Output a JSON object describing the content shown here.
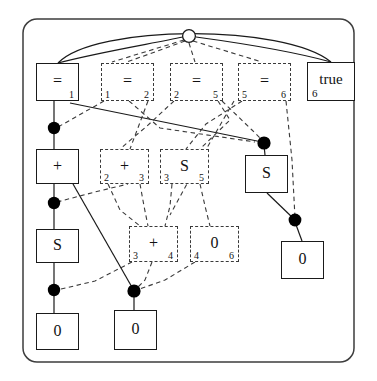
{
  "figure": {
    "frame": {
      "shape": "rounded-rectangle",
      "stroke": "#3d3d3d"
    },
    "colors": {
      "solid_stroke": "#1a1a1a",
      "dashed_stroke": "#3a3a3a",
      "node_fill": "#ffffff",
      "dot_fill": "#000000",
      "root_fill": "#ffffff"
    },
    "root": {
      "label": "",
      "kind": "hollow-circle",
      "x": 189,
      "y": 36,
      "r": 6
    },
    "nodes": [
      {
        "id": "eq1",
        "symbol": "=",
        "sub_left": "",
        "sub_right": "1",
        "style": "solid",
        "x": 36,
        "y": 63,
        "w": 43,
        "h": 38
      },
      {
        "id": "eq12",
        "symbol": "=",
        "sub_left": "1",
        "sub_right": "2",
        "style": "dashed",
        "x": 101,
        "y": 63,
        "w": 53,
        "h": 38
      },
      {
        "id": "eq25",
        "symbol": "=",
        "sub_left": "2",
        "sub_right": "5",
        "style": "dashed",
        "x": 170,
        "y": 63,
        "w": 53,
        "h": 38
      },
      {
        "id": "eq56",
        "symbol": "=",
        "sub_left": "5",
        "sub_right": "6",
        "style": "dashed",
        "x": 238,
        "y": 63,
        "w": 53,
        "h": 38
      },
      {
        "id": "true6",
        "symbol": "true",
        "sub_left": "6",
        "sub_right": "",
        "style": "solid",
        "x": 307,
        "y": 62,
        "w": 48,
        "h": 39
      },
      {
        "id": "plusL",
        "symbol": "+",
        "sub_left": "",
        "sub_right": "",
        "style": "solid",
        "x": 36,
        "y": 149,
        "w": 43,
        "h": 35
      },
      {
        "id": "plus23",
        "symbol": "+",
        "sub_left": "2",
        "sub_right": "3",
        "style": "dashed",
        "x": 100,
        "y": 149,
        "w": 49,
        "h": 35
      },
      {
        "id": "s35",
        "symbol": "S",
        "sub_left": "3",
        "sub_right": "5",
        "style": "dashed",
        "x": 160,
        "y": 149,
        "w": 49,
        "h": 35
      },
      {
        "id": "sR",
        "symbol": "S",
        "sub_left": "",
        "sub_right": "",
        "style": "solid",
        "x": 245,
        "y": 155,
        "w": 43,
        "h": 38
      },
      {
        "id": "sL",
        "symbol": "S",
        "sub_left": "",
        "sub_right": "",
        "style": "solid",
        "x": 36,
        "y": 229,
        "w": 43,
        "h": 34
      },
      {
        "id": "plus34",
        "symbol": "+",
        "sub_left": "3",
        "sub_right": "4",
        "style": "dashed",
        "x": 129,
        "y": 226,
        "w": 49,
        "h": 36
      },
      {
        "id": "zero46",
        "symbol": "0",
        "sub_left": "4",
        "sub_right": "6",
        "style": "dashed",
        "x": 190,
        "y": 226,
        "w": 49,
        "h": 36
      },
      {
        "id": "zeroR",
        "symbol": "0",
        "sub_left": "",
        "sub_right": "",
        "style": "solid",
        "x": 281,
        "y": 241,
        "w": 43,
        "h": 38
      },
      {
        "id": "zeroL",
        "symbol": "0",
        "sub_left": "",
        "sub_right": "",
        "style": "solid",
        "x": 36,
        "y": 313,
        "w": 43,
        "h": 37
      },
      {
        "id": "zeroC",
        "symbol": "0",
        "sub_left": "",
        "sub_right": "",
        "style": "solid",
        "x": 114,
        "y": 310,
        "w": 43,
        "h": 40
      }
    ],
    "dots": [
      {
        "id": "d1",
        "x": 54,
        "y": 128
      },
      {
        "id": "d2",
        "x": 54,
        "y": 203
      },
      {
        "id": "d3",
        "x": 54,
        "y": 290
      },
      {
        "id": "d4",
        "x": 134,
        "y": 291
      },
      {
        "id": "d5",
        "x": 264,
        "y": 143
      },
      {
        "id": "d6",
        "x": 295,
        "y": 220
      }
    ]
  }
}
